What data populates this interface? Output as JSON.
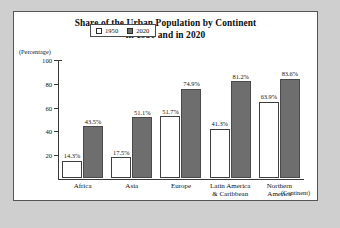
{
  "chart_data": {
    "type": "bar",
    "title": "Share of the Urban Population by Continent in 1950 and in 2020",
    "title_line1": "Share of the Urban Population by Continent",
    "title_line2": "in 1950 and in 2020",
    "ylabel": "(Percentage)",
    "xlabel": "(Continent)",
    "ylim": [
      0,
      100
    ],
    "yticks": [
      0,
      20,
      40,
      60,
      80,
      100
    ],
    "ytick_labels": [
      "",
      "20",
      "40",
      "60",
      "80",
      "100"
    ],
    "grid": false,
    "legend_position": "top-left-inside",
    "categories": [
      "Africa",
      "Asia",
      "Europe",
      "Latin America & Caribbean",
      "Northern America"
    ],
    "category_lines": [
      [
        "Africa"
      ],
      [
        "Asia"
      ],
      [
        "Europe"
      ],
      [
        "Latin America",
        "& Caribbean"
      ],
      [
        "Northern",
        "America"
      ]
    ],
    "series": [
      {
        "name": "1950",
        "color": "#ffffff",
        "values": [
          14.3,
          17.5,
          51.7,
          41.3,
          63.9
        ],
        "labels": [
          "14.3%",
          "17.5%",
          "51.7%",
          "41.3%",
          "63.9%"
        ]
      },
      {
        "name": "2020",
        "color": "#6e6e6e",
        "values": [
          43.5,
          51.1,
          74.9,
          81.2,
          83.6
        ],
        "labels": [
          "43.5%",
          "51.1%",
          "74.9%",
          "81.2%",
          "83.6%"
        ]
      }
    ]
  },
  "legend": {
    "items": [
      {
        "label": "1950",
        "swatch": "open"
      },
      {
        "label": "2020",
        "swatch": "fill"
      }
    ]
  },
  "colors": {
    "page_background": "#cfcfcf",
    "card_background": "#ffffff",
    "axis": "#3a3a3a",
    "bar_1950": "#ffffff",
    "bar_2020": "#6e6e6e",
    "text": "#111111"
  }
}
